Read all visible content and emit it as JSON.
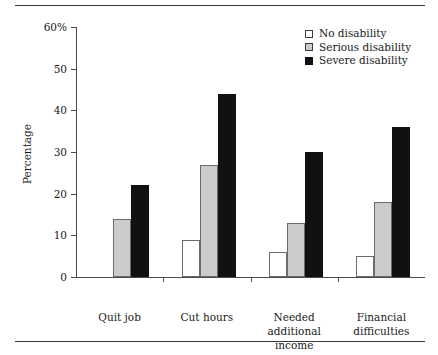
{
  "chart_data": {
    "type": "bar",
    "title": "",
    "subtitle": "",
    "xlabel": "",
    "ylabel": "Percentage",
    "ylim": [
      0,
      60
    ],
    "y_ticks": [
      0,
      10,
      20,
      30,
      40,
      50,
      60
    ],
    "y_tick_labels": [
      "0",
      "10",
      "20",
      "30",
      "40",
      "50",
      "60%"
    ],
    "grid": false,
    "legend_position": "top-right",
    "categories": [
      "Quit job",
      "Needed\nadditional\nincome",
      "Financial\ndifficulties",
      "Cut hours"
    ],
    "category_labels": [
      {
        "lines": [
          "Quit job"
        ]
      },
      {
        "lines": [
          "Cut hours"
        ]
      },
      {
        "lines": [
          "Needed",
          "additional",
          "income"
        ]
      },
      {
        "lines": [
          "Financial",
          "difficulties"
        ]
      }
    ],
    "series": [
      {
        "name": "No disability",
        "color": "#ffffff",
        "values": [
          null,
          9,
          6,
          5
        ]
      },
      {
        "name": "Serious disability",
        "color": "#cbcbcb",
        "values": [
          14,
          27,
          13,
          18
        ]
      },
      {
        "name": "Severe disability",
        "color": "#111111",
        "values": [
          22,
          44,
          30,
          36
        ]
      }
    ]
  },
  "legend": {
    "entries": [
      {
        "label": "No disability"
      },
      {
        "label": "Serious disability"
      },
      {
        "label": "Severe disability"
      }
    ]
  },
  "colors": {
    "axis": "#4a4a4a",
    "rule": "#3a3a3a",
    "text": "#1a1a1a",
    "no_disability": "#ffffff",
    "serious_disability": "#cbcbcb",
    "severe_disability": "#111111"
  }
}
